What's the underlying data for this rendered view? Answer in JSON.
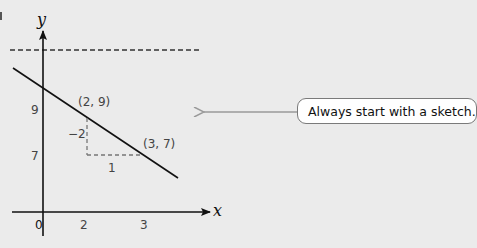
{
  "diagram": {
    "axes": {
      "x_label": "x",
      "y_label": "y",
      "origin_label": "0",
      "x_ticks": [
        "2",
        "3"
      ],
      "y_ticks": [
        "9",
        "7"
      ]
    },
    "points": [
      {
        "label": "(2, 9)",
        "x": 2,
        "y": 9
      },
      {
        "label": "(3, 7)",
        "x": 3,
        "y": 7
      }
    ],
    "slope_triangle": {
      "rise_label": "−2",
      "run_label": "1"
    },
    "callout": {
      "text": "Always start with a sketch."
    },
    "colors": {
      "background": "#ebebeb",
      "line": "#111111",
      "dashed": "#777777",
      "arrow": "#9a9a9a",
      "callout_bg": "#ffffff",
      "callout_border": "#7a7a7a"
    }
  }
}
